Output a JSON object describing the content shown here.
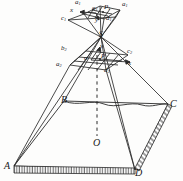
{
  "figure": {
    "type": "line-diagram",
    "stroke_color": "#2a2a2a",
    "background": "#fdfdfc"
  },
  "labels": {
    "top_plane": {
      "a1_left": "a",
      "a1_left_sub": "1",
      "a1_right": "a",
      "a1_right_sub": "1",
      "c1": "c",
      "c1_sub": "1",
      "p1": "P",
      "p1_sub": "1",
      "o1": "o",
      "o1_sub": "1",
      "d1": "d",
      "d1_sub": "1",
      "x_axis": "x",
      "y_axis": "y"
    },
    "apex": {
      "s": "S"
    },
    "mid_plane": {
      "b2": "b",
      "b2_sub": "2",
      "c2": "c",
      "c2_sub": "2",
      "a2": "a",
      "a2_sub": "2",
      "d2": "d",
      "d2_sub": "2",
      "o": "o",
      "p": "P",
      "x_axis": "x",
      "y_axis": "y"
    },
    "ground": {
      "A": "A",
      "B": "B",
      "C": "C",
      "D": "D",
      "O": "O"
    }
  },
  "geometry": {
    "top_plane_polygon": "84,14 100,6 120,10 104,19",
    "top_plane_inner": "86,15 98,8 117,11 103,18",
    "mid_plane_polygon": "70,65 86,51 128,55 106,70",
    "apex_point": "101,37",
    "ground_polygon": "14,166 64,101 168,104 135,170",
    "center_point": "97,143",
    "dashed_axis": "97,55 97,136"
  }
}
